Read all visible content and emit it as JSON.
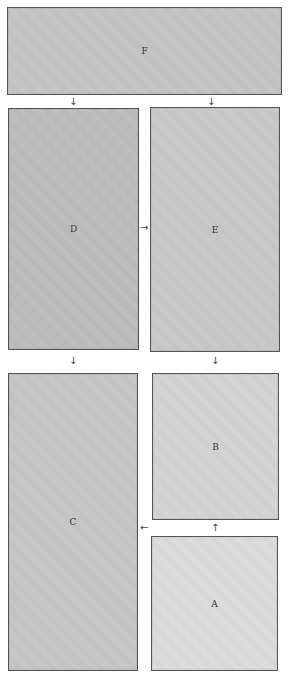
{
  "panels": {
    "F": {
      "label": "F",
      "color": "#c4c4c4"
    },
    "D": {
      "label": "D",
      "color": "#bcbcbc"
    },
    "E": {
      "label": "E",
      "color": "#c8c8c8"
    },
    "C": {
      "label": "C",
      "color": "#c6c6c6"
    },
    "B": {
      "label": "B",
      "color": "#d4d4d4"
    },
    "A": {
      "label": "A",
      "color": "#dcdcdc"
    }
  },
  "arrows": {
    "f_to_d": "↓",
    "f_to_e": "↓",
    "d_to_e": "→",
    "d_to_c": "↓",
    "e_to_b": "↓",
    "a_to_b": "↑",
    "a_to_c": "←"
  }
}
